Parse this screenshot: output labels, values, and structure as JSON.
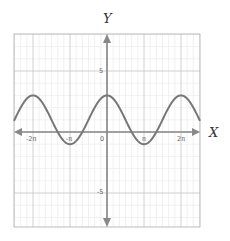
{
  "chart_data": {
    "type": "line",
    "title": "",
    "xlabel": "X",
    "ylabel": "Y",
    "function": "y = 1 + 2cos(x)",
    "xlim_pi": [
      -2.5,
      2.5
    ],
    "ylim": [
      -9,
      8
    ],
    "grid": true,
    "legend": null,
    "x_ticks": [
      {
        "value_pi": -2,
        "label": "-2π"
      },
      {
        "value_pi": -1,
        "label": "-π"
      },
      {
        "value_pi": 0,
        "label": "0"
      },
      {
        "value_pi": 1,
        "label": "π"
      },
      {
        "value_pi": 2,
        "label": "2π"
      }
    ],
    "y_ticks": [
      {
        "value": 5,
        "label": "5"
      },
      {
        "value": -5,
        "label": "-5"
      }
    ],
    "key_points": [
      {
        "x": "-2π",
        "y": 3
      },
      {
        "x": "-π",
        "y": -1
      },
      {
        "x": "0",
        "y": 3
      },
      {
        "x": "π",
        "y": -1
      },
      {
        "x": "2π",
        "y": 3
      }
    ],
    "series": [
      {
        "name": "y = 1 + 2cos(x)",
        "color": "#777777",
        "amplitude": 2,
        "vertical_shift": 1,
        "period": "2π"
      }
    ]
  },
  "labels": {
    "x_axis": "X",
    "y_axis": "Y",
    "tick_neg_2pi": "-2π",
    "tick_neg_pi": "-π",
    "tick_zero": "0",
    "tick_pi": "π",
    "tick_2pi": "2π",
    "tick_5": "5",
    "tick_neg5": "-5"
  },
  "colors": {
    "curve": "#777777",
    "axes": "#888888",
    "grid_major": "#bdbdbd",
    "grid_minor": "#e6e6e6",
    "frame": "#aaaaaa"
  }
}
